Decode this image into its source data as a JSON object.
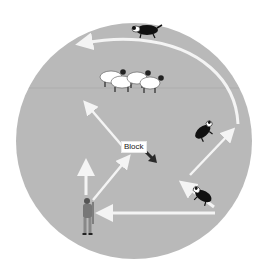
{
  "diagram": {
    "colors": {
      "field": "#b9b9b9",
      "arrow": "#f4f4f4",
      "block_arrow": "#2a2a2a",
      "background": "#ffffff"
    },
    "labels": {
      "block": "Block"
    },
    "elements": {
      "flock": "sheep-flock",
      "dogs": [
        "dog-top-outrun",
        "dog-right-upper",
        "dog-right-lower"
      ],
      "handler": "shepherd"
    }
  }
}
